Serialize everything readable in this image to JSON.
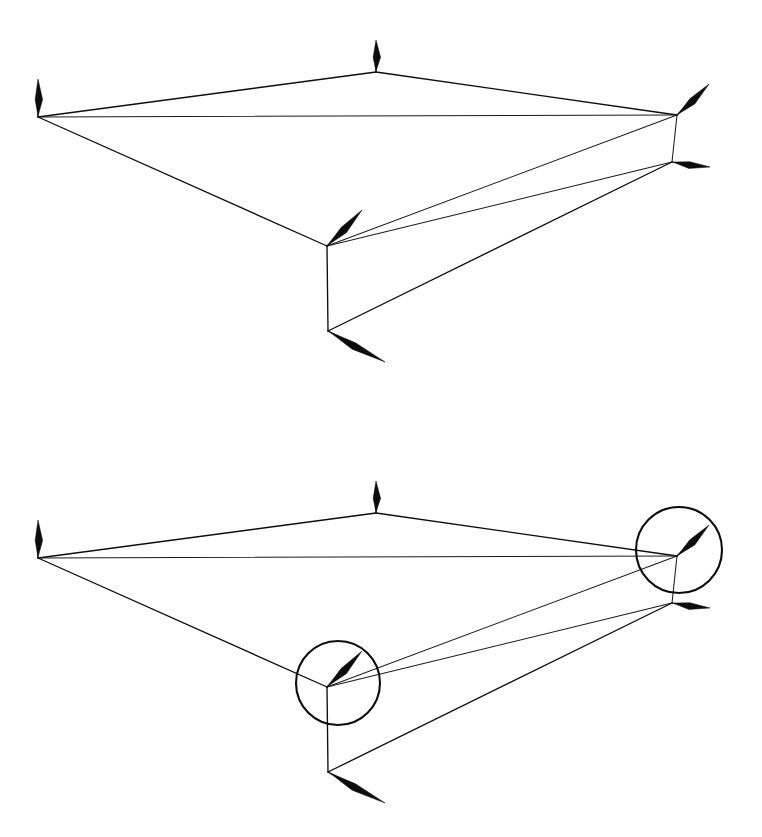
{
  "figure": {
    "background_color": "#ffffff",
    "line_color": "#0d0d0d",
    "panel_count": 2
  },
  "panels": [
    {
      "id": "panel-top",
      "label": "upper-diagram",
      "offset_y": 0,
      "has_callouts": false,
      "callouts": []
    },
    {
      "id": "panel-bottom",
      "label": "lower-diagram",
      "offset_y": 441,
      "has_callouts": true,
      "callouts": [
        {
          "id": "callout-left",
          "label": "circle-highlight-vertex-c",
          "cx": 338,
          "cy": 242,
          "r": 42
        },
        {
          "id": "callout-right",
          "label": "circle-highlight-vertex-b",
          "cx": 679,
          "cy": 109,
          "r": 43
        }
      ]
    }
  ],
  "geometry": {
    "vertices": [
      {
        "id": "A",
        "name": "left-vertex",
        "x": 38,
        "y": 117
      },
      {
        "id": "B",
        "name": "apex-vertex",
        "x": 376,
        "y": 72
      },
      {
        "id": "C",
        "name": "right-upper-vertex",
        "x": 677,
        "y": 115
      },
      {
        "id": "D",
        "name": "right-lower-vertex",
        "x": 672,
        "y": 162
      },
      {
        "id": "E",
        "name": "mid-lower-vertex",
        "x": 327,
        "y": 246
      },
      {
        "id": "F",
        "name": "bottom-vertex",
        "x": 328,
        "y": 331
      }
    ],
    "edges": [
      {
        "from": "A",
        "to": "B",
        "weight": "thick"
      },
      {
        "from": "B",
        "to": "C",
        "weight": "thick"
      },
      {
        "from": "A",
        "to": "C",
        "weight": "thin"
      },
      {
        "from": "A",
        "to": "E",
        "weight": "thick"
      },
      {
        "from": "E",
        "to": "C",
        "weight": "thin"
      },
      {
        "from": "E",
        "to": "D",
        "weight": "thin"
      },
      {
        "from": "C",
        "to": "D",
        "weight": "thin"
      },
      {
        "from": "E",
        "to": "F",
        "weight": "thick"
      },
      {
        "from": "F",
        "to": "D",
        "weight": "thick"
      }
    ],
    "arrows": [
      {
        "id": "arrow-A",
        "name": "vector-arrow-left-vertex",
        "at": "A",
        "tip_x": 38,
        "tip_y": 79,
        "width": 4.6
      },
      {
        "id": "arrow-B",
        "name": "vector-arrow-apex-vertex",
        "at": "B",
        "tip_x": 376,
        "tip_y": 40,
        "width": 4.6
      },
      {
        "id": "arrow-C",
        "name": "vector-arrow-right-upper-vertex",
        "at": "C",
        "tip_x": 709,
        "tip_y": 84,
        "width": 4.4
      },
      {
        "id": "arrow-D",
        "name": "vector-arrow-right-lower-vertex",
        "at": "D",
        "tip_x": 710,
        "tip_y": 167,
        "width": 4.2
      },
      {
        "id": "arrow-E",
        "name": "vector-arrow-mid-lower-vertex",
        "at": "E",
        "tip_x": 362,
        "tip_y": 210,
        "width": 4.6
      },
      {
        "id": "arrow-F",
        "name": "vector-arrow-bottom-vertex",
        "at": "F",
        "tip_x": 385,
        "tip_y": 362,
        "width": 4.4
      }
    ]
  }
}
